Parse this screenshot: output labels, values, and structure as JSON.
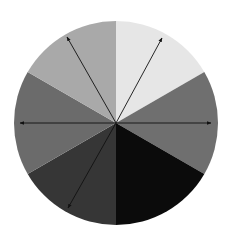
{
  "diagram": {
    "type": "sector-wheel",
    "center": {
      "x": 116,
      "y": 123
    },
    "radius": 102,
    "sectors": [
      {
        "name": "sector-top-right",
        "start_deg": -90,
        "end_deg": -30,
        "color": "#e6e6e6"
      },
      {
        "name": "sector-right",
        "start_deg": -30,
        "end_deg": 30,
        "color": "#6f6f6f"
      },
      {
        "name": "sector-bottom-right",
        "start_deg": 30,
        "end_deg": 90,
        "color": "#0b0b0b"
      },
      {
        "name": "sector-bottom-left",
        "start_deg": 90,
        "end_deg": 150,
        "color": "#363636"
      },
      {
        "name": "sector-left",
        "start_deg": 150,
        "end_deg": 210,
        "color": "#6b6b6b"
      },
      {
        "name": "sector-top-left",
        "start_deg": 210,
        "end_deg": 270,
        "color": "#a9a9a9"
      }
    ],
    "arrows": [
      {
        "name": "arrow-upper-left",
        "tip": {
          "x": 67,
          "y": 37
        }
      },
      {
        "name": "arrow-upper-right",
        "tip": {
          "x": 162,
          "y": 38
        }
      },
      {
        "name": "arrow-left",
        "tip": {
          "x": 20,
          "y": 123
        }
      },
      {
        "name": "arrow-right",
        "tip": {
          "x": 211,
          "y": 123
        }
      },
      {
        "name": "arrow-lower-left",
        "tip": {
          "x": 68,
          "y": 208
        }
      }
    ],
    "arrow_color": "#111111"
  }
}
